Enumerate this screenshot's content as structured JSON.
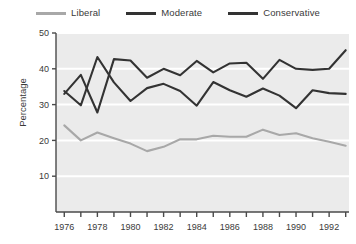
{
  "chart_data": {
    "type": "line",
    "title": "",
    "xlabel": "",
    "ylabel": "Percentage",
    "xlim": [
      1975.5,
      1993.2
    ],
    "ylim": [
      0,
      50
    ],
    "yticks": [
      10,
      20,
      30,
      40,
      50
    ],
    "xticks": [
      1976,
      1977,
      1978,
      1979,
      1980,
      1981,
      1982,
      1983,
      1984,
      1985,
      1986,
      1987,
      1988,
      1989,
      1990,
      1991,
      1992,
      1993
    ],
    "xticklabels": [
      "1976",
      "",
      "1978",
      "",
      "1980",
      "",
      "1982",
      "",
      "1984",
      "",
      "1986",
      "",
      "1988",
      "",
      "1990",
      "",
      "1992",
      ""
    ],
    "yticklabels": [
      "10",
      "20",
      "30",
      "40",
      "50"
    ],
    "grid": "horizontal-white",
    "legend_position": "top-center",
    "x": [
      1976,
      1977,
      1978,
      1979,
      1980,
      1981,
      1982,
      1983,
      1984,
      1985,
      1986,
      1987,
      1988,
      1989,
      1990,
      1991,
      1992,
      1993
    ],
    "series": [
      {
        "name": "Liberal",
        "color": "#a8a8a8",
        "values": [
          24.2,
          20.0,
          22.2,
          20.6,
          19.1,
          17.0,
          18.2,
          20.3,
          20.3,
          21.3,
          21.0,
          21.0,
          23.0,
          21.5,
          22.0,
          20.6,
          19.6,
          18.5
        ]
      },
      {
        "name": "Moderate",
        "color": "#333333",
        "values": [
          33.0,
          38.3,
          27.8,
          42.7,
          42.3,
          37.5,
          40.0,
          38.2,
          42.2,
          39.0,
          41.5,
          41.7,
          37.2,
          42.5,
          40.0,
          39.7,
          40.0,
          45.2
        ]
      },
      {
        "name": "Conservative",
        "color": "#333333",
        "values": [
          33.8,
          29.8,
          43.3,
          36.2,
          31.0,
          34.6,
          35.8,
          33.8,
          29.7,
          36.3,
          34.0,
          32.2,
          34.5,
          32.5,
          29.0,
          34.0,
          33.2,
          33.0
        ]
      }
    ]
  },
  "legend": {
    "items": [
      {
        "label": "Liberal",
        "color": "#a8a8a8"
      },
      {
        "label": "Moderate",
        "color": "#333333"
      },
      {
        "label": "Conservative",
        "color": "#333333"
      }
    ]
  },
  "axes": {
    "y_axis_title": "Percentage"
  },
  "colors": {
    "plot_background": "#ebebeb",
    "gridline": "#ffffff",
    "axis": "#4a4a4a",
    "text": "#3a3a3a"
  }
}
